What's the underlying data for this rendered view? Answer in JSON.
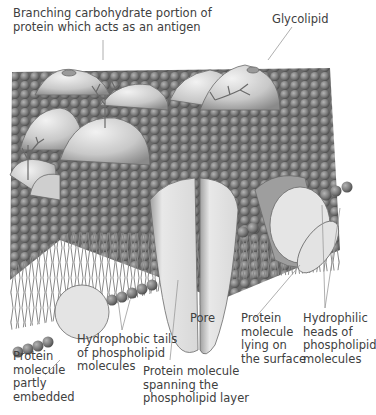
{
  "diagram": {
    "labels": {
      "carbohydrate": [
        "Branching carbohydrate portion of",
        "protein which acts as an antigen"
      ],
      "glycolipid": [
        "Glycolipid"
      ],
      "pore": [
        "Pore"
      ],
      "hydrophobic_tails": [
        "Hydrophobic tails",
        "of phospholipid",
        "molecules"
      ],
      "protein_partly_embedded": [
        "Protein",
        "molecule",
        "partly",
        "embedded"
      ],
      "protein_spanning": [
        "Protein molecule",
        "spanning the",
        "phospholipid layer"
      ],
      "protein_surface": [
        "Protein",
        "molecule",
        "lying on",
        "the surface"
      ],
      "hydrophilic_heads": [
        "Hydrophilic",
        "heads of",
        "phospholipid",
        "molecules"
      ]
    },
    "colors": {
      "head": "#7a7a7a",
      "head_dark": "#555555",
      "protein": "#e6e6e6",
      "protein_shade": "#9a9a9a",
      "line": "#8a8a8a",
      "tail": "#888888"
    }
  }
}
